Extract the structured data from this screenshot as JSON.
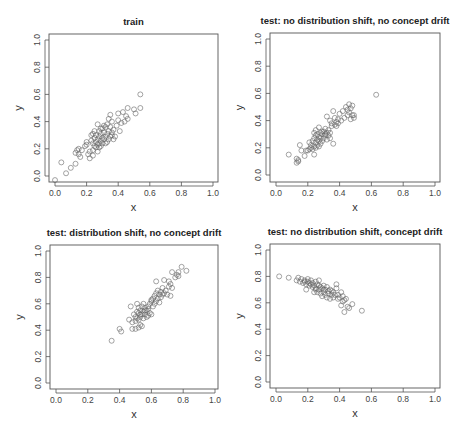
{
  "figure": {
    "width": 459,
    "height": 431,
    "point_color": "#666666",
    "frame_color": "#555555"
  },
  "chart_data": [
    {
      "type": "scatter",
      "title": "train",
      "xlabel": "x",
      "ylabel": "y",
      "xlim": [
        0,
        1
      ],
      "ylim": [
        0,
        1
      ],
      "xticks": [
        "0.0",
        "0.2",
        "0.4",
        "0.6",
        "0.8",
        "1.0"
      ],
      "yticks": [
        "0.0",
        "0.2",
        "0.4",
        "0.6",
        "0.8",
        "1.0"
      ],
      "grid": false,
      "layout": {
        "left": 49,
        "top": 34,
        "right": 218,
        "bottom": 182,
        "x0": 55,
        "x1": 213,
        "y0": 176,
        "y1": 40
      },
      "points": [
        [
          0.0,
          -0.03
        ],
        [
          0.04,
          0.1
        ],
        [
          0.07,
          0.02
        ],
        [
          0.1,
          0.06
        ],
        [
          0.13,
          0.09
        ],
        [
          0.13,
          0.17
        ],
        [
          0.14,
          0.19
        ],
        [
          0.15,
          0.2
        ],
        [
          0.16,
          0.14
        ],
        [
          0.17,
          0.19
        ],
        [
          0.19,
          0.22
        ],
        [
          0.2,
          0.25
        ],
        [
          0.21,
          0.16
        ],
        [
          0.22,
          0.13
        ],
        [
          0.22,
          0.18
        ],
        [
          0.23,
          0.26
        ],
        [
          0.23,
          0.3
        ],
        [
          0.24,
          0.15
        ],
        [
          0.24,
          0.19
        ],
        [
          0.24,
          0.31
        ],
        [
          0.25,
          0.22
        ],
        [
          0.25,
          0.28
        ],
        [
          0.26,
          0.25
        ],
        [
          0.26,
          0.3
        ],
        [
          0.27,
          0.18
        ],
        [
          0.27,
          0.23
        ],
        [
          0.27,
          0.27
        ],
        [
          0.27,
          0.38
        ],
        [
          0.28,
          0.21
        ],
        [
          0.28,
          0.24
        ],
        [
          0.28,
          0.29
        ],
        [
          0.28,
          0.33
        ],
        [
          0.29,
          0.22
        ],
        [
          0.29,
          0.26
        ],
        [
          0.29,
          0.31
        ],
        [
          0.3,
          0.24
        ],
        [
          0.3,
          0.28
        ],
        [
          0.3,
          0.35
        ],
        [
          0.31,
          0.27
        ],
        [
          0.31,
          0.32
        ],
        [
          0.32,
          0.24
        ],
        [
          0.32,
          0.29
        ],
        [
          0.32,
          0.36
        ],
        [
          0.33,
          0.31
        ],
        [
          0.33,
          0.38
        ],
        [
          0.34,
          0.27
        ],
        [
          0.34,
          0.33
        ],
        [
          0.34,
          0.42
        ],
        [
          0.35,
          0.29
        ],
        [
          0.35,
          0.36
        ],
        [
          0.35,
          0.45
        ],
        [
          0.36,
          0.3
        ],
        [
          0.36,
          0.4
        ],
        [
          0.37,
          0.27
        ],
        [
          0.37,
          0.34
        ],
        [
          0.38,
          0.29
        ],
        [
          0.39,
          0.37
        ],
        [
          0.4,
          0.41
        ],
        [
          0.4,
          0.46
        ],
        [
          0.41,
          0.33
        ],
        [
          0.42,
          0.39
        ],
        [
          0.43,
          0.47
        ],
        [
          0.44,
          0.4
        ],
        [
          0.45,
          0.44
        ],
        [
          0.46,
          0.5
        ],
        [
          0.46,
          0.42
        ],
        [
          0.5,
          0.49
        ],
        [
          0.51,
          0.46
        ],
        [
          0.54,
          0.5
        ],
        [
          0.54,
          0.6
        ],
        [
          0.24,
          0.24
        ],
        [
          0.26,
          0.21
        ],
        [
          0.31,
          0.37
        ],
        [
          0.33,
          0.25
        ],
        [
          0.36,
          0.32
        ],
        [
          0.15,
          0.16
        ],
        [
          0.2,
          0.23
        ],
        [
          0.29,
          0.35
        ],
        [
          0.25,
          0.33
        ]
      ]
    },
    {
      "type": "scatter",
      "title": "test: no distribution shift, no concept drift",
      "xlabel": "x",
      "ylabel": "y",
      "xlim": [
        0,
        1
      ],
      "ylim": [
        0,
        1
      ],
      "xticks": [
        "0.0",
        "0.2",
        "0.4",
        "0.6",
        "0.8",
        "1.0"
      ],
      "yticks": [
        "0.0",
        "0.2",
        "0.4",
        "0.6",
        "0.8",
        "1.0"
      ],
      "grid": false,
      "layout": {
        "left": 270,
        "top": 33,
        "right": 440,
        "bottom": 182,
        "x0": 276,
        "x1": 435,
        "y0": 175,
        "y1": 39
      },
      "points": [
        [
          0.08,
          0.15
        ],
        [
          0.13,
          0.09
        ],
        [
          0.13,
          0.12
        ],
        [
          0.14,
          0.1
        ],
        [
          0.14,
          0.11
        ],
        [
          0.15,
          0.22
        ],
        [
          0.16,
          0.18
        ],
        [
          0.18,
          0.14
        ],
        [
          0.19,
          0.18
        ],
        [
          0.2,
          0.18
        ],
        [
          0.21,
          0.19
        ],
        [
          0.21,
          0.24
        ],
        [
          0.22,
          0.22
        ],
        [
          0.23,
          0.19
        ],
        [
          0.23,
          0.25
        ],
        [
          0.24,
          0.15
        ],
        [
          0.24,
          0.21
        ],
        [
          0.24,
          0.27
        ],
        [
          0.24,
          0.31
        ],
        [
          0.25,
          0.2
        ],
        [
          0.25,
          0.24
        ],
        [
          0.25,
          0.29
        ],
        [
          0.25,
          0.33
        ],
        [
          0.26,
          0.22
        ],
        [
          0.26,
          0.26
        ],
        [
          0.26,
          0.3
        ],
        [
          0.27,
          0.21
        ],
        [
          0.27,
          0.28
        ],
        [
          0.27,
          0.35
        ],
        [
          0.28,
          0.23
        ],
        [
          0.28,
          0.27
        ],
        [
          0.28,
          0.31
        ],
        [
          0.29,
          0.25
        ],
        [
          0.29,
          0.3
        ],
        [
          0.3,
          0.27
        ],
        [
          0.3,
          0.32
        ],
        [
          0.31,
          0.29
        ],
        [
          0.31,
          0.34
        ],
        [
          0.32,
          0.26
        ],
        [
          0.32,
          0.31
        ],
        [
          0.32,
          0.43
        ],
        [
          0.33,
          0.29
        ],
        [
          0.33,
          0.33
        ],
        [
          0.34,
          0.27
        ],
        [
          0.34,
          0.31
        ],
        [
          0.34,
          0.4
        ],
        [
          0.35,
          0.38
        ],
        [
          0.36,
          0.23
        ],
        [
          0.36,
          0.47
        ],
        [
          0.37,
          0.37
        ],
        [
          0.37,
          0.42
        ],
        [
          0.38,
          0.36
        ],
        [
          0.38,
          0.39
        ],
        [
          0.39,
          0.38
        ],
        [
          0.39,
          0.41
        ],
        [
          0.4,
          0.45
        ],
        [
          0.41,
          0.4
        ],
        [
          0.42,
          0.47
        ],
        [
          0.43,
          0.42
        ],
        [
          0.44,
          0.5
        ],
        [
          0.45,
          0.44
        ],
        [
          0.45,
          0.48
        ],
        [
          0.46,
          0.46
        ],
        [
          0.46,
          0.52
        ],
        [
          0.47,
          0.41
        ],
        [
          0.47,
          0.49
        ],
        [
          0.48,
          0.44
        ],
        [
          0.48,
          0.51
        ],
        [
          0.49,
          0.42
        ],
        [
          0.49,
          0.44
        ],
        [
          0.63,
          0.59
        ],
        [
          0.22,
          0.2
        ],
        [
          0.29,
          0.32
        ],
        [
          0.31,
          0.3
        ],
        [
          0.27,
          0.25
        ],
        [
          0.35,
          0.36
        ]
      ]
    },
    {
      "type": "scatter",
      "title": "test: distribution shift, no concept drift",
      "xlabel": "x",
      "ylabel": "y",
      "xlim": [
        0,
        1
      ],
      "ylim": [
        0,
        1
      ],
      "xticks": [
        "0.0",
        "0.2",
        "0.4",
        "0.6",
        "0.8",
        "1.0"
      ],
      "yticks": [
        "0.0",
        "0.2",
        "0.4",
        "0.6",
        "0.8",
        "1.0"
      ],
      "grid": false,
      "layout": {
        "left": 50,
        "top": 245,
        "right": 218,
        "bottom": 389,
        "x0": 56,
        "x1": 215,
        "y0": 383,
        "y1": 251
      },
      "points": [
        [
          0.35,
          0.32
        ],
        [
          0.4,
          0.41
        ],
        [
          0.41,
          0.39
        ],
        [
          0.46,
          0.48
        ],
        [
          0.47,
          0.58
        ],
        [
          0.48,
          0.41
        ],
        [
          0.48,
          0.46
        ],
        [
          0.49,
          0.52
        ],
        [
          0.5,
          0.41
        ],
        [
          0.5,
          0.47
        ],
        [
          0.5,
          0.5
        ],
        [
          0.51,
          0.54
        ],
        [
          0.51,
          0.6
        ],
        [
          0.52,
          0.42
        ],
        [
          0.52,
          0.48
        ],
        [
          0.52,
          0.53
        ],
        [
          0.52,
          0.57
        ],
        [
          0.53,
          0.44
        ],
        [
          0.53,
          0.5
        ],
        [
          0.53,
          0.55
        ],
        [
          0.54,
          0.43
        ],
        [
          0.54,
          0.52
        ],
        [
          0.54,
          0.58
        ],
        [
          0.55,
          0.49
        ],
        [
          0.55,
          0.54
        ],
        [
          0.55,
          0.6
        ],
        [
          0.56,
          0.52
        ],
        [
          0.56,
          0.57
        ],
        [
          0.57,
          0.5
        ],
        [
          0.57,
          0.55
        ],
        [
          0.58,
          0.51
        ],
        [
          0.58,
          0.58
        ],
        [
          0.59,
          0.53
        ],
        [
          0.59,
          0.6
        ],
        [
          0.6,
          0.52
        ],
        [
          0.6,
          0.62
        ],
        [
          0.61,
          0.58
        ],
        [
          0.61,
          0.64
        ],
        [
          0.62,
          0.6
        ],
        [
          0.62,
          0.66
        ],
        [
          0.63,
          0.62
        ],
        [
          0.63,
          0.68
        ],
        [
          0.63,
          0.77
        ],
        [
          0.64,
          0.64
        ],
        [
          0.64,
          0.7
        ],
        [
          0.65,
          0.61
        ],
        [
          0.65,
          0.67
        ],
        [
          0.66,
          0.65
        ],
        [
          0.66,
          0.69
        ],
        [
          0.67,
          0.67
        ],
        [
          0.67,
          0.72
        ],
        [
          0.68,
          0.68
        ],
        [
          0.68,
          0.78
        ],
        [
          0.69,
          0.7
        ],
        [
          0.7,
          0.67
        ],
        [
          0.71,
          0.73
        ],
        [
          0.71,
          0.77
        ],
        [
          0.72,
          0.66
        ],
        [
          0.72,
          0.75
        ],
        [
          0.73,
          0.72
        ],
        [
          0.73,
          0.84
        ],
        [
          0.75,
          0.8
        ],
        [
          0.76,
          0.82
        ],
        [
          0.77,
          0.81
        ],
        [
          0.77,
          0.84
        ],
        [
          0.79,
          0.88
        ],
        [
          0.82,
          0.85
        ],
        [
          0.53,
          0.52
        ],
        [
          0.56,
          0.55
        ],
        [
          0.6,
          0.63
        ],
        [
          0.51,
          0.49
        ],
        [
          0.58,
          0.56
        ]
      ]
    },
    {
      "type": "scatter",
      "title": "test: no distribution shift, concept drift",
      "xlabel": "x",
      "ylabel": "y",
      "xlim": [
        0,
        1
      ],
      "ylim": [
        0,
        1
      ],
      "xticks": [
        "0.0",
        "0.2",
        "0.4",
        "0.6",
        "0.8",
        "1.0"
      ],
      "yticks": [
        "0.0",
        "0.2",
        "0.4",
        "0.6",
        "0.8",
        "1.0"
      ],
      "grid": false,
      "layout": {
        "left": 270,
        "top": 244,
        "right": 440,
        "bottom": 388,
        "x0": 276,
        "x1": 435,
        "y0": 382,
        "y1": 250
      },
      "points": [
        [
          0.02,
          0.8
        ],
        [
          0.08,
          0.79
        ],
        [
          0.13,
          0.77
        ],
        [
          0.14,
          0.79
        ],
        [
          0.15,
          0.76
        ],
        [
          0.16,
          0.78
        ],
        [
          0.17,
          0.75
        ],
        [
          0.18,
          0.77
        ],
        [
          0.19,
          0.7
        ],
        [
          0.19,
          0.74
        ],
        [
          0.2,
          0.76
        ],
        [
          0.2,
          0.78
        ],
        [
          0.21,
          0.73
        ],
        [
          0.21,
          0.75
        ],
        [
          0.22,
          0.74
        ],
        [
          0.22,
          0.77
        ],
        [
          0.23,
          0.72
        ],
        [
          0.23,
          0.75
        ],
        [
          0.24,
          0.68
        ],
        [
          0.24,
          0.73
        ],
        [
          0.25,
          0.71
        ],
        [
          0.25,
          0.76
        ],
        [
          0.26,
          0.68
        ],
        [
          0.26,
          0.74
        ],
        [
          0.27,
          0.7
        ],
        [
          0.27,
          0.77
        ],
        [
          0.28,
          0.67
        ],
        [
          0.28,
          0.72
        ],
        [
          0.29,
          0.65
        ],
        [
          0.29,
          0.71
        ],
        [
          0.3,
          0.68
        ],
        [
          0.3,
          0.73
        ],
        [
          0.31,
          0.66
        ],
        [
          0.31,
          0.7
        ],
        [
          0.32,
          0.64
        ],
        [
          0.32,
          0.72
        ],
        [
          0.33,
          0.67
        ],
        [
          0.33,
          0.69
        ],
        [
          0.34,
          0.63
        ],
        [
          0.34,
          0.7
        ],
        [
          0.35,
          0.66
        ],
        [
          0.36,
          0.64
        ],
        [
          0.36,
          0.68
        ],
        [
          0.37,
          0.66
        ],
        [
          0.38,
          0.74
        ],
        [
          0.38,
          0.71
        ],
        [
          0.39,
          0.63
        ],
        [
          0.39,
          0.66
        ],
        [
          0.4,
          0.64
        ],
        [
          0.41,
          0.68
        ],
        [
          0.41,
          0.58
        ],
        [
          0.42,
          0.61
        ],
        [
          0.42,
          0.65
        ],
        [
          0.43,
          0.53
        ],
        [
          0.43,
          0.62
        ],
        [
          0.44,
          0.63
        ],
        [
          0.45,
          0.57
        ],
        [
          0.46,
          0.56
        ],
        [
          0.48,
          0.59
        ],
        [
          0.54,
          0.54
        ],
        [
          0.25,
          0.7
        ],
        [
          0.3,
          0.7
        ],
        [
          0.35,
          0.69
        ],
        [
          0.18,
          0.76
        ],
        [
          0.27,
          0.73
        ]
      ]
    }
  ]
}
